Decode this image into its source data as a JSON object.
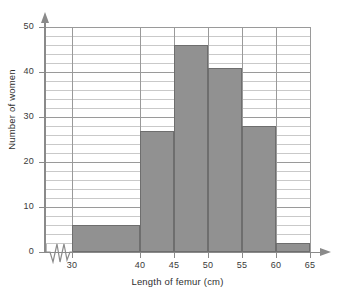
{
  "chart_data": {
    "type": "bar",
    "title": "",
    "xlabel": "Length of femur (cm)",
    "ylabel": "Number of women",
    "categories": [
      "30-40",
      "40-45",
      "45-50",
      "50-55",
      "55-60",
      "60-65"
    ],
    "bin_edges": [
      30,
      40,
      45,
      50,
      55,
      60,
      65
    ],
    "values": [
      6,
      27,
      46,
      41,
      28,
      2
    ],
    "xlim": [
      30,
      65
    ],
    "ylim": [
      0,
      50
    ],
    "x_ticks": [
      30,
      40,
      45,
      50,
      55,
      60,
      65
    ],
    "y_ticks": [
      0,
      10,
      20,
      30,
      40,
      50
    ],
    "y_minor_step": 2,
    "grid": true,
    "legend": "none",
    "bar_color": "#919191",
    "bar_edge_color": "#6e6e6e",
    "grid_color": "#c9c9c9",
    "axis_color": "#8a8a8a",
    "axis_break": "zigzag-on-x-axis-between-origin-and-30",
    "annotations": []
  },
  "axis": {
    "x_title": "Length of femur (cm)",
    "y_title": "Number of women",
    "x_tick_labels": [
      "30",
      "40",
      "45",
      "50",
      "55",
      "60",
      "65"
    ],
    "y_tick_labels": [
      "0",
      "10",
      "20",
      "30",
      "40",
      "50"
    ]
  },
  "icons": {
    "x_arrow": "arrow-right-icon",
    "y_arrow": "arrow-up-icon",
    "break": "axis-break-zigzag-icon"
  }
}
